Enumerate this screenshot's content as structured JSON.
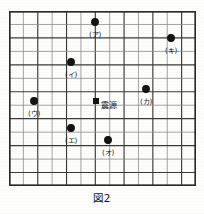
{
  "figure": {
    "caption": "図2",
    "grid": {
      "columns": 13,
      "rows": 13,
      "cell_width": 14.4,
      "cell_height": 13.5,
      "border_color": "#2b2b2b",
      "line_color_dark": "#3a3a3a",
      "line_color_light": "#8d8d8d"
    },
    "epicenter": {
      "label": "震源",
      "marker": "filled-square",
      "col": 6,
      "row": 6.7,
      "x": 87,
      "y": 90,
      "label_dx": 5,
      "label_dy": 0
    },
    "points": [
      {
        "id": "a",
        "label": "(ア)",
        "x": 86,
        "y": 11,
        "label_dy": 9
      },
      {
        "id": "b",
        "label": "(キ)",
        "x": 162,
        "y": 27,
        "label_dy": 9
      },
      {
        "id": "c",
        "label": "(イ)",
        "x": 62,
        "y": 51,
        "label_dy": 9
      },
      {
        "id": "d",
        "label": "(カ)",
        "x": 137,
        "y": 78,
        "label_dy": 9
      },
      {
        "id": "e",
        "label": "(ウ)",
        "x": 25,
        "y": 90,
        "label_dy": 9
      },
      {
        "id": "f",
        "label": "(エ)",
        "x": 62,
        "y": 117,
        "label_dy": 9
      },
      {
        "id": "g",
        "label": "(オ)",
        "x": 99,
        "y": 129,
        "label_dy": 9
      }
    ]
  }
}
